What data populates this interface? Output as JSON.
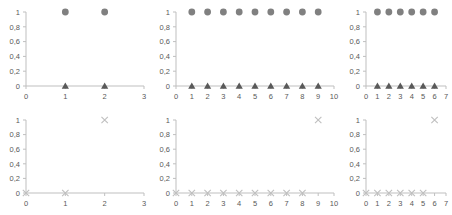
{
  "figure": {
    "panel_count": 6,
    "rows": 2,
    "cols": 3,
    "background": "#ffffff"
  },
  "style": {
    "circle_color": "#808080",
    "triangle_color": "#595959",
    "x_color": "#bfbfbf",
    "axis_color": "#bfbfbf",
    "label_color": "#595959"
  },
  "yticks": [
    "0",
    "0,2",
    "0,4",
    "0,6",
    "0,8",
    "1"
  ],
  "chart_data": [
    {
      "id": "panel-top-left",
      "type": "scatter",
      "title": "",
      "xlabel": "",
      "ylabel": "",
      "xlim": [
        0,
        3
      ],
      "ylim": [
        0,
        1
      ],
      "xticks": [
        "0",
        "1",
        "2",
        "3"
      ],
      "yticks": [
        "0",
        "0,2",
        "0,4",
        "0,6",
        "0,8",
        "1"
      ],
      "grid": false,
      "legend": "none",
      "series": [
        {
          "name": "circle-series",
          "marker": "circle",
          "color": "#808080",
          "x": [
            1,
            2
          ],
          "values": [
            1,
            1
          ]
        },
        {
          "name": "triangle-series",
          "marker": "triangle",
          "color": "#595959",
          "x": [
            1,
            2
          ],
          "values": [
            0,
            0
          ]
        }
      ]
    },
    {
      "id": "panel-top-middle",
      "type": "scatter",
      "title": "",
      "xlabel": "",
      "ylabel": "",
      "xlim": [
        0,
        10
      ],
      "ylim": [
        0,
        1
      ],
      "xticks": [
        "0",
        "1",
        "2",
        "3",
        "4",
        "5",
        "6",
        "7",
        "8",
        "9",
        "10"
      ],
      "yticks": [
        "0",
        "0,2",
        "0,4",
        "0,6",
        "0,8",
        "1"
      ],
      "grid": false,
      "legend": "none",
      "series": [
        {
          "name": "circle-series",
          "marker": "circle",
          "color": "#808080",
          "x": [
            1,
            2,
            3,
            4,
            5,
            6,
            7,
            8,
            9
          ],
          "values": [
            1,
            1,
            1,
            1,
            1,
            1,
            1,
            1,
            1
          ]
        },
        {
          "name": "triangle-series",
          "marker": "triangle",
          "color": "#595959",
          "x": [
            1,
            2,
            3,
            4,
            5,
            6,
            7,
            8,
            9
          ],
          "values": [
            0,
            0,
            0,
            0,
            0,
            0,
            0,
            0,
            0
          ]
        }
      ]
    },
    {
      "id": "panel-top-right",
      "type": "scatter",
      "title": "",
      "xlabel": "",
      "ylabel": "",
      "xlim": [
        0,
        7
      ],
      "ylim": [
        0,
        1
      ],
      "xticks": [
        "0",
        "1",
        "2",
        "3",
        "4",
        "5",
        "6",
        "7"
      ],
      "yticks": [
        "0",
        "0,2",
        "0,4",
        "0,6",
        "0,8",
        "1"
      ],
      "grid": false,
      "legend": "none",
      "series": [
        {
          "name": "circle-series",
          "marker": "circle",
          "color": "#808080",
          "x": [
            1,
            2,
            3,
            4,
            5,
            6
          ],
          "values": [
            1,
            1,
            1,
            1,
            1,
            1
          ]
        },
        {
          "name": "triangle-series",
          "marker": "triangle",
          "color": "#595959",
          "x": [
            1,
            2,
            3,
            4,
            5,
            6
          ],
          "values": [
            0,
            0,
            0,
            0,
            0,
            0
          ]
        }
      ]
    },
    {
      "id": "panel-bottom-left",
      "type": "scatter",
      "title": "",
      "xlabel": "",
      "ylabel": "",
      "xlim": [
        0,
        3
      ],
      "ylim": [
        0,
        1
      ],
      "xticks": [
        "0",
        "1",
        "2",
        "3"
      ],
      "yticks": [
        "0",
        "0,2",
        "0,4",
        "0,6",
        "0,8",
        "1"
      ],
      "grid": false,
      "legend": "none",
      "series": [
        {
          "name": "x-series",
          "marker": "x",
          "color": "#bfbfbf",
          "x": [
            0,
            1,
            2
          ],
          "values": [
            0,
            0,
            1
          ]
        }
      ]
    },
    {
      "id": "panel-bottom-middle",
      "type": "scatter",
      "title": "",
      "xlabel": "",
      "ylabel": "",
      "xlim": [
        0,
        10
      ],
      "ylim": [
        0,
        1
      ],
      "xticks": [
        "0",
        "1",
        "2",
        "3",
        "4",
        "5",
        "6",
        "7",
        "8",
        "9",
        "10"
      ],
      "yticks": [
        "0",
        "0,2",
        "0,4",
        "0,6",
        "0,8",
        "1"
      ],
      "grid": false,
      "legend": "none",
      "series": [
        {
          "name": "x-series",
          "marker": "x",
          "color": "#bfbfbf",
          "x": [
            0,
            1,
            2,
            3,
            4,
            5,
            6,
            7,
            8,
            9
          ],
          "values": [
            0,
            0,
            0,
            0,
            0,
            0,
            0,
            0,
            0,
            1
          ]
        }
      ]
    },
    {
      "id": "panel-bottom-right",
      "type": "scatter",
      "title": "",
      "xlabel": "",
      "ylabel": "",
      "xlim": [
        0,
        7
      ],
      "ylim": [
        0,
        1
      ],
      "xticks": [
        "0",
        "1",
        "2",
        "3",
        "4",
        "5",
        "6",
        "7"
      ],
      "yticks": [
        "0",
        "0,2",
        "0,4",
        "0,6",
        "0,8",
        "1"
      ],
      "grid": false,
      "legend": "none",
      "series": [
        {
          "name": "x-series",
          "marker": "x",
          "color": "#bfbfbf",
          "x": [
            0,
            1,
            2,
            3,
            4,
            5,
            6
          ],
          "values": [
            0,
            0,
            0,
            0,
            0,
            0,
            1
          ]
        }
      ]
    }
  ]
}
